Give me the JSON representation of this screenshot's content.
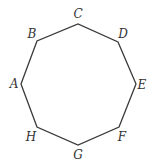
{
  "figure": {
    "type": "regular-octagon",
    "stroke_color": "#3a3a3a",
    "label_color": "#333333",
    "vertices": [
      {
        "name": "A",
        "x": 21,
        "y": 84,
        "label_x": 14,
        "label_y": 88
      },
      {
        "name": "B",
        "x": 37,
        "y": 41,
        "label_x": 32,
        "label_y": 38
      },
      {
        "name": "C",
        "x": 78,
        "y": 24,
        "label_x": 78,
        "label_y": 18
      },
      {
        "name": "D",
        "x": 118,
        "y": 42,
        "label_x": 123,
        "label_y": 38
      },
      {
        "name": "E",
        "x": 136,
        "y": 84,
        "label_x": 142,
        "label_y": 89
      },
      {
        "name": "F",
        "x": 119,
        "y": 127,
        "label_x": 122,
        "label_y": 141
      },
      {
        "name": "G",
        "x": 78,
        "y": 145,
        "label_x": 78,
        "label_y": 159
      },
      {
        "name": "H",
        "x": 37,
        "y": 127,
        "label_x": 31,
        "label_y": 141
      }
    ]
  }
}
